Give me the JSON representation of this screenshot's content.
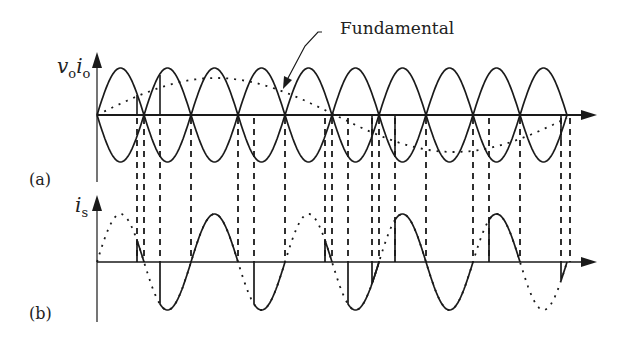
{
  "figure": {
    "annotation": "Fundamental",
    "panel_a": {
      "label": "(a)",
      "y_label_main": "v",
      "y_label_sub1": "o",
      "y_label_mid": "i",
      "y_label_sub2": "o"
    },
    "panel_b": {
      "label": "(b)",
      "y_label_main": "i",
      "y_label_sub": "s"
    }
  },
  "colors": {
    "stroke": "#1a1a1a",
    "background": "#ffffff"
  },
  "geometry": {
    "x0": 97,
    "half_period": 47,
    "cycles_halves": 10,
    "top_axis_y": 115,
    "top_amp": 47,
    "bottom_axis_y": 262,
    "bottom_amp": 48,
    "dashed_x": [
      137,
      144,
      160,
      191,
      238,
      254,
      285,
      325,
      332,
      348,
      372,
      379,
      395,
      426,
      473,
      489,
      520,
      561,
      570
    ]
  }
}
